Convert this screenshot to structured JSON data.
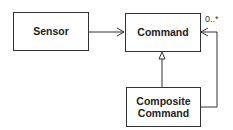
{
  "diagram": {
    "type": "UML class diagram",
    "nodes": [
      {
        "id": "sensor",
        "label": "Sensor"
      },
      {
        "id": "command",
        "label": "Command"
      },
      {
        "id": "composite",
        "label_line1": "Composite",
        "label_line2": "Command"
      }
    ],
    "edges": [
      {
        "from": "sensor",
        "to": "command",
        "type": "association (navigable)"
      },
      {
        "from": "composite",
        "to": "command",
        "type": "generalization"
      },
      {
        "from": "composite",
        "to": "command",
        "type": "association (navigable)",
        "multiplicity": "0..*"
      }
    ],
    "multiplicity_label": "0..*"
  }
}
